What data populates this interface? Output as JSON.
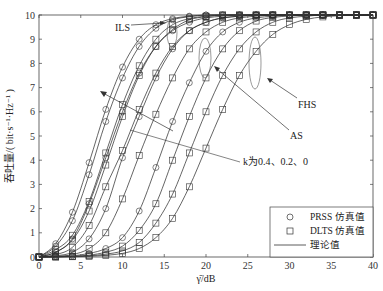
{
  "chart_data": {
    "type": "line",
    "title": "",
    "xlabel": "γ̄/dB",
    "ylabel": "吞吐量/( bit·s⁻¹·Hz⁻¹ )",
    "xlim": [
      0,
      40
    ],
    "ylim": [
      0,
      10
    ],
    "xticks": [
      "0",
      "5",
      "10",
      "15",
      "20",
      "25",
      "30",
      "35",
      "40"
    ],
    "yticks": [
      "0",
      "1",
      "2",
      "3",
      "4",
      "5",
      "6",
      "7",
      "8",
      "9",
      "10"
    ],
    "grid": false,
    "legend_position": "bottom-right",
    "legend": [
      {
        "marker": "circle",
        "label": "PRSS 仿真值"
      },
      {
        "marker": "square",
        "label": "DLTS 仿真值"
      },
      {
        "marker": "line",
        "label": "理论值"
      }
    ],
    "annotations": [
      {
        "text": "ILS"
      },
      {
        "text": "FHS"
      },
      {
        "text": "AS"
      },
      {
        "text": "k为0.4、0.2、0"
      }
    ],
    "x": [
      0,
      2,
      4,
      6,
      8,
      10,
      12,
      14,
      16,
      18,
      20,
      22,
      24,
      26,
      28,
      30,
      32,
      34,
      36,
      38,
      40
    ],
    "series": [
      {
        "name": "ILS PRSS k=0.4",
        "marker": "circle",
        "values": [
          0,
          0.55,
          1.85,
          3.9,
          6.1,
          7.85,
          9.0,
          9.6,
          9.85,
          9.95,
          10,
          10,
          10,
          10,
          10,
          10,
          10,
          10,
          10,
          10,
          10
        ]
      },
      {
        "name": "ILS DLTS k=0.4",
        "marker": "square",
        "values": [
          0,
          0.3,
          0.9,
          2.3,
          4.3,
          6.3,
          7.9,
          9.0,
          9.6,
          9.85,
          9.95,
          10,
          10,
          10,
          10,
          10,
          10,
          10,
          10,
          10,
          10
        ]
      },
      {
        "name": "ILS PRSS k=0.2",
        "marker": "circle",
        "values": [
          0,
          0.45,
          1.5,
          3.4,
          5.6,
          7.4,
          8.7,
          9.45,
          9.8,
          9.93,
          10,
          10,
          10,
          10,
          10,
          10,
          10,
          10,
          10,
          10,
          10
        ]
      },
      {
        "name": "ILS DLTS k=0.2",
        "marker": "square",
        "values": [
          0,
          0.2,
          0.7,
          1.9,
          3.8,
          5.8,
          7.5,
          8.7,
          9.4,
          9.8,
          9.93,
          10,
          10,
          10,
          10,
          10,
          10,
          10,
          10,
          10,
          10
        ]
      },
      {
        "name": "AS PRSS k=0.4",
        "marker": "circle",
        "values": [
          0,
          0.2,
          0.75,
          2.2,
          4.1,
          6.0,
          7.6,
          8.7,
          9.35,
          9.7,
          9.88,
          9.95,
          10,
          10,
          10,
          10,
          10,
          10,
          10,
          10,
          10
        ]
      },
      {
        "name": "AS DLTS k=0.4",
        "marker": "square",
        "values": [
          0,
          0.1,
          0.4,
          1.3,
          2.9,
          4.4,
          6.1,
          7.6,
          8.7,
          9.35,
          9.7,
          9.88,
          9.95,
          10,
          10,
          10,
          10,
          10,
          10,
          10,
          10
        ]
      },
      {
        "name": "AS PRSS k=0.2",
        "marker": "circle",
        "values": [
          0,
          0.05,
          0.2,
          0.75,
          2.0,
          4.1,
          5.8,
          7.4,
          8.6,
          9.35,
          9.7,
          9.88,
          9.95,
          10,
          10,
          10,
          10,
          10,
          10,
          10,
          10
        ]
      },
      {
        "name": "AS DLTS k=0.2",
        "marker": "square",
        "values": [
          0,
          0.02,
          0.1,
          0.35,
          1.0,
          2.4,
          4.2,
          5.9,
          7.4,
          8.6,
          9.3,
          9.7,
          9.88,
          9.95,
          10,
          10,
          10,
          10,
          10,
          10,
          10
        ]
      },
      {
        "name": "FHS PRSS k=0",
        "marker": "circle",
        "values": [
          0,
          0.02,
          0.05,
          0.15,
          0.35,
          0.8,
          1.9,
          3.7,
          5.6,
          7.2,
          8.5,
          9.3,
          9.7,
          9.88,
          9.95,
          10,
          10,
          10,
          10,
          10,
          10
        ]
      },
      {
        "name": "FHS DLTS k=0",
        "marker": "square",
        "values": [
          0,
          0.01,
          0.03,
          0.08,
          0.2,
          0.45,
          1.1,
          2.2,
          4.0,
          5.8,
          7.4,
          8.6,
          9.35,
          9.75,
          9.9,
          9.96,
          10,
          10,
          10,
          10,
          10
        ]
      },
      {
        "name": "AS DLTS k=0",
        "marker": "square",
        "values": [
          0,
          0.0,
          0.02,
          0.05,
          0.12,
          0.25,
          0.6,
          1.4,
          2.6,
          4.3,
          6.0,
          7.5,
          8.6,
          9.3,
          9.7,
          9.88,
          9.95,
          10,
          10,
          10,
          10
        ]
      },
      {
        "name": "FHS DLTS k=0 (low)",
        "marker": "square",
        "values": [
          0,
          0.0,
          0.01,
          0.03,
          0.07,
          0.15,
          0.35,
          0.8,
          1.6,
          2.9,
          4.5,
          6.1,
          7.5,
          8.5,
          9.2,
          9.6,
          9.82,
          9.92,
          9.97,
          10,
          10
        ]
      }
    ]
  }
}
